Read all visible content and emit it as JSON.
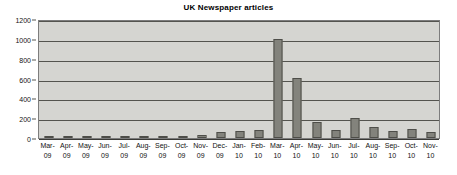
{
  "chart_data": {
    "type": "bar",
    "title": "UK Newspaper articles",
    "xlabel": "",
    "ylabel": "",
    "ylim": [
      0,
      1200
    ],
    "ytick_step": 200,
    "yticks": [
      0,
      200,
      400,
      600,
      800,
      1000,
      1200
    ],
    "grid": true,
    "legend": null,
    "categories": [
      "Mar-09",
      "Apr-09",
      "May-09",
      "Jun-09",
      "Jul-09",
      "Aug-09",
      "Sep-09",
      "Oct-09",
      "Nov-09",
      "Dec-09",
      "Jan-10",
      "Feb-10",
      "Mar-10",
      "Apr-10",
      "May-10",
      "Jun-10",
      "Jul-10",
      "Aug-10",
      "Sep-10",
      "Oct-10",
      "Nov-10"
    ],
    "category_lines": [
      [
        "Mar-",
        "09"
      ],
      [
        "Apr-",
        "09"
      ],
      [
        "May-",
        "09"
      ],
      [
        "Jun-",
        "09"
      ],
      [
        "Jul-",
        "09"
      ],
      [
        "Aug-",
        "09"
      ],
      [
        "Sep-",
        "09"
      ],
      [
        "Oct-",
        "09"
      ],
      [
        "Nov-",
        "09"
      ],
      [
        "Dec-",
        "09"
      ],
      [
        "Jan-",
        "10"
      ],
      [
        "Feb-",
        "10"
      ],
      [
        "Mar-",
        "10"
      ],
      [
        "Apr-",
        "10"
      ],
      [
        "May-",
        "10"
      ],
      [
        "Jun-",
        "10"
      ],
      [
        "Jul-",
        "10"
      ],
      [
        "Aug-",
        "10"
      ],
      [
        "Sep-",
        "10"
      ],
      [
        "Oct-",
        "10"
      ],
      [
        "Nov-",
        "10"
      ]
    ],
    "values": [
      5,
      8,
      3,
      2,
      10,
      3,
      10,
      12,
      35,
      60,
      70,
      85,
      1000,
      605,
      165,
      80,
      205,
      110,
      75,
      88,
      65
    ],
    "colors": {
      "bar_fill": "#83837c",
      "bar_stroke": "#4e4e49",
      "plot_background": "#d5d5d1",
      "gridline": "#54544f",
      "plot_border": "#7d7d7d",
      "text": "#111111",
      "page_background": "#ffffff"
    }
  }
}
